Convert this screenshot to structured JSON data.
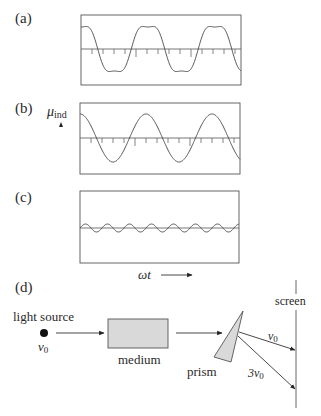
{
  "figure": {
    "panels": [
      {
        "id": "a",
        "label": "(a)",
        "description": "distorted wave: fundamental plus third harmonic",
        "box": {
          "x": 81,
          "y": 15,
          "w": 160,
          "h": 70
        },
        "axis_y": 49,
        "components": [
          {
            "harmonic": 1,
            "amplitude": 26,
            "phase": 0
          },
          {
            "harmonic": 3,
            "amplitude": 4,
            "phase": 0
          }
        ],
        "period_px": 67
      },
      {
        "id": "b",
        "label": "(b)",
        "y_label": "μ",
        "y_label_sub": "ind",
        "description": "fundamental component",
        "box": {
          "x": 80,
          "y": 103,
          "w": 160,
          "h": 71
        },
        "axis_y": 138,
        "components": [
          {
            "harmonic": 1,
            "amplitude": 24,
            "phase": 0
          }
        ],
        "period_px": 66
      },
      {
        "id": "c",
        "label": "(c)",
        "description": "third-harmonic component",
        "box": {
          "x": 80,
          "y": 191,
          "w": 159,
          "h": 72
        },
        "axis_y": 228,
        "components": [
          {
            "harmonic": 3,
            "amplitude": 4,
            "phase": 0
          }
        ],
        "period_px": 66
      }
    ],
    "x_axis_label": "ωt",
    "ticks": {
      "spacing_px": 11,
      "long_every": 5
    },
    "setup": {
      "label": "(d)",
      "light_source_label": "light source",
      "source_frequency": "ν",
      "source_frequency_sub": "0",
      "medium_label": "medium",
      "prism_label": "prism",
      "screen_label": "screen",
      "ray_1_label": "ν",
      "ray_1_sub": "0",
      "ray_2_label": "3ν",
      "ray_2_sub": "0",
      "medium_fill": "#d9d9d9",
      "prism_fill": "#d9d9d9"
    }
  }
}
